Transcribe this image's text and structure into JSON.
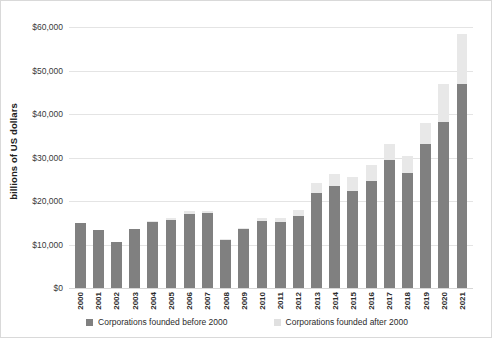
{
  "chart_data": {
    "type": "bar",
    "subtype": "stacked-column",
    "title": "",
    "xlabel": "",
    "ylabel": "billions of US dollars",
    "ylim": [
      0,
      60000
    ],
    "yticks": [
      0,
      10000,
      20000,
      30000,
      40000,
      50000,
      60000
    ],
    "ytick_labels": [
      "$0",
      "$10,000",
      "$20,000",
      "$30,000",
      "$40,000",
      "$50,000",
      "$60,000"
    ],
    "grid": true,
    "legend_position": "bottom",
    "categories": [
      "2000",
      "2001",
      "2002",
      "2003",
      "2004",
      "2005",
      "2006",
      "2007",
      "2008",
      "2009",
      "2010",
      "2011",
      "2012",
      "2013",
      "2014",
      "2015",
      "2016",
      "2017",
      "2018",
      "2019",
      "2020",
      "2021"
    ],
    "series": [
      {
        "name": "Corporations founded before 2000",
        "color": "#808080",
        "values": [
          15000,
          13400,
          10600,
          13500,
          15200,
          15700,
          17100,
          17200,
          11100,
          13500,
          15400,
          15200,
          16600,
          21900,
          23500,
          22400,
          24600,
          29400,
          26500,
          33000,
          38200,
          47000
        ]
      },
      {
        "name": "Corporations founded after 2000",
        "color": "#e8e8e8",
        "values": [
          0,
          0,
          0,
          0,
          100,
          300,
          500,
          600,
          200,
          400,
          800,
          800,
          1300,
          2300,
          2600,
          3200,
          3600,
          3800,
          3800,
          5000,
          8800,
          11500
        ]
      }
    ],
    "totals": [
      15000,
      13400,
      10600,
      13500,
      15300,
      16000,
      17600,
      17800,
      11300,
      13900,
      16200,
      16000,
      17900,
      24200,
      26100,
      25600,
      28200,
      33200,
      30300,
      38000,
      47000,
      58500
    ]
  },
  "legend": {
    "items": [
      {
        "label": "Corporations founded before 2000",
        "color": "#808080",
        "swatch_icon": "square-swatch-icon"
      },
      {
        "label": "Corporations founded after 2000",
        "color": "#e0e0e0",
        "swatch_icon": "square-swatch-icon"
      }
    ]
  },
  "colors": {
    "before_2000": "#808080",
    "after_2000": "#e8e8e8",
    "gridline": "#e4e4e4",
    "border": "#d9d9d9",
    "text": "#2b2b2b"
  }
}
